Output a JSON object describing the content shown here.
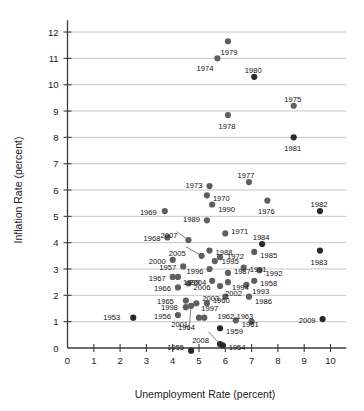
{
  "chart_data": {
    "type": "scatter",
    "title": "",
    "xlabel": "Unemployment Rate (percent)",
    "ylabel": "Inflation Rate (percent)",
    "xlim": [
      0,
      10.6
    ],
    "ylim": [
      0,
      12.4
    ],
    "xticks": [
      "0",
      "1",
      "2",
      "3",
      "4",
      "5",
      "6",
      "7",
      "8",
      "9",
      "10"
    ],
    "yticks": [
      "0",
      "1",
      "2",
      "3",
      "4",
      "5",
      "6",
      "7",
      "8",
      "9",
      "10",
      "11",
      "12"
    ],
    "grid": "horizontal",
    "legend": "none",
    "point_label_key": "year",
    "points": [
      {
        "year": "1953",
        "x": 2.5,
        "y": 1.15,
        "lx": -13,
        "ly": -1,
        "anchor": "end",
        "dark": true
      },
      {
        "year": "1954",
        "x": 5.9,
        "y": 0.1,
        "lx": 6,
        "ly": 2,
        "anchor": "start",
        "dark": true
      },
      {
        "year": "1955",
        "x": 4.7,
        "y": -0.1,
        "lx": -7,
        "ly": -4,
        "anchor": "end",
        "dark": true
      },
      {
        "year": "1956",
        "x": 4.2,
        "y": 1.25,
        "lx": -7,
        "ly": 1,
        "anchor": "end",
        "dark": false
      },
      {
        "year": "1957",
        "x": 4.4,
        "y": 3.1,
        "lx": -7,
        "ly": 1,
        "anchor": "end",
        "dark": false
      },
      {
        "year": "1958",
        "x": 7.1,
        "y": 2.55,
        "lx": 6,
        "ly": 2,
        "anchor": "start",
        "dark": false
      },
      {
        "year": "1959",
        "x": 5.8,
        "y": 0.75,
        "lx": 6,
        "ly": 3,
        "anchor": "start",
        "dark": true
      },
      {
        "year": "1960",
        "x": 5.3,
        "y": 1.7,
        "lx": 6,
        "ly": -3,
        "anchor": "start",
        "dark": false
      },
      {
        "year": "1961",
        "x": 6.4,
        "y": 1.05,
        "lx": 6,
        "ly": 4,
        "anchor": "start",
        "dark": false
      },
      {
        "year": "1962",
        "x": 5.2,
        "y": 1.15,
        "lx": 7,
        "ly": -3,
        "anchor": "start",
        "dark": false
      },
      {
        "year": "1963",
        "x": 7.0,
        "y": 1.0,
        "lx": -3,
        "ly": -4,
        "anchor": "end",
        "dark": false
      },
      {
        "year": "1964",
        "x": 5.0,
        "y": 1.15,
        "lx": -4,
        "ly": 9,
        "anchor": "end",
        "dark": false
      },
      {
        "year": "1965",
        "x": 4.5,
        "y": 1.8,
        "lx": -12,
        "ly": 0,
        "anchor": "end",
        "dark": false
      },
      {
        "year": "1966",
        "x": 4.2,
        "y": 2.3,
        "lx": -7,
        "ly": 1,
        "anchor": "end",
        "dark": false
      },
      {
        "year": "1967",
        "x": 4.0,
        "y": 2.7,
        "lx": -7,
        "ly": 1,
        "anchor": "end",
        "dark": false
      },
      {
        "year": "1968",
        "x": 3.8,
        "y": 4.2,
        "lx": -7,
        "ly": 1,
        "anchor": "end",
        "dark": false
      },
      {
        "year": "1969",
        "x": 3.7,
        "y": 5.2,
        "lx": -8,
        "ly": 1,
        "anchor": "end",
        "dark": false
      },
      {
        "year": "1970",
        "x": 5.3,
        "y": 5.8,
        "lx": 6,
        "ly": 3,
        "anchor": "start",
        "dark": false
      },
      {
        "year": "1971",
        "x": 6.0,
        "y": 4.35,
        "lx": 6,
        "ly": -2,
        "anchor": "start",
        "dark": false
      },
      {
        "year": "1972",
        "x": 5.8,
        "y": 3.45,
        "lx": 7,
        "ly": -1,
        "anchor": "start",
        "dark": false
      },
      {
        "year": "1973",
        "x": 5.4,
        "y": 6.15,
        "lx": -7,
        "ly": -1,
        "anchor": "end",
        "dark": false
      },
      {
        "year": "1974",
        "x": 5.7,
        "y": 11.0,
        "lx": -4,
        "ly": 10,
        "anchor": "end",
        "dark": false
      },
      {
        "year": "1975",
        "x": 8.6,
        "y": 9.2,
        "lx": -1,
        "ly": -7,
        "anchor": "middle",
        "dark": false
      },
      {
        "year": "1976",
        "x": 7.6,
        "y": 5.6,
        "lx": -1,
        "ly": 10,
        "anchor": "middle",
        "dark": false
      },
      {
        "year": "1977",
        "x": 6.9,
        "y": 6.3,
        "lx": -3,
        "ly": -7,
        "anchor": "middle",
        "dark": false
      },
      {
        "year": "1978",
        "x": 6.1,
        "y": 8.85,
        "lx": -1,
        "ly": 11,
        "anchor": "middle",
        "dark": false
      },
      {
        "year": "1979",
        "x": 6.1,
        "y": 11.65,
        "lx": 1,
        "ly": 11,
        "anchor": "middle",
        "dark": false
      },
      {
        "year": "1980",
        "x": 7.1,
        "y": 10.3,
        "lx": -1,
        "ly": -7,
        "anchor": "middle",
        "dark": true
      },
      {
        "year": "1981",
        "x": 8.6,
        "y": 8.0,
        "lx": -1,
        "ly": 11,
        "anchor": "middle",
        "dark": true
      },
      {
        "year": "1982",
        "x": 9.6,
        "y": 5.2,
        "lx": -1,
        "ly": -7,
        "anchor": "middle",
        "dark": true
      },
      {
        "year": "1983",
        "x": 9.6,
        "y": 3.7,
        "lx": -1,
        "ly": 11,
        "anchor": "middle",
        "dark": true
      },
      {
        "year": "1984",
        "x": 7.4,
        "y": 3.95,
        "lx": -1,
        "ly": -7,
        "anchor": "middle",
        "dark": true
      },
      {
        "year": "1985",
        "x": 7.1,
        "y": 3.65,
        "lx": 6,
        "ly": 3,
        "anchor": "start",
        "dark": false
      },
      {
        "year": "1986",
        "x": 6.9,
        "y": 1.95,
        "lx": 6,
        "ly": 4,
        "anchor": "start",
        "dark": false
      },
      {
        "year": "1987",
        "x": 6.1,
        "y": 2.85,
        "lx": 6,
        "ly": -2,
        "anchor": "start",
        "dark": false
      },
      {
        "year": "1988",
        "x": 5.4,
        "y": 3.7,
        "lx": 6,
        "ly": 1,
        "anchor": "start",
        "dark": false
      },
      {
        "year": "1989",
        "x": 5.3,
        "y": 4.85,
        "lx": -7,
        "ly": -1,
        "anchor": "end",
        "dark": false
      },
      {
        "year": "1990",
        "x": 5.5,
        "y": 5.45,
        "lx": 6,
        "ly": 4,
        "anchor": "start",
        "dark": false
      },
      {
        "year": "1991",
        "x": 6.7,
        "y": 3.05,
        "lx": 6,
        "ly": 1,
        "anchor": "start",
        "dark": false
      },
      {
        "year": "1992",
        "x": 7.3,
        "y": 2.95,
        "lx": 6,
        "ly": 3,
        "anchor": "start",
        "dark": false
      },
      {
        "year": "1993",
        "x": 6.8,
        "y": 2.4,
        "lx": 6,
        "ly": 6,
        "anchor": "start",
        "dark": false
      },
      {
        "year": "1994",
        "x": 6.1,
        "y": 2.5,
        "lx": 4,
        "ly": 5,
        "anchor": "start",
        "dark": false
      },
      {
        "year": "1995",
        "x": 5.6,
        "y": 3.3,
        "lx": 7,
        "ly": 0,
        "anchor": "start",
        "dark": false
      },
      {
        "year": "1996",
        "x": 5.4,
        "y": 3.0,
        "lx": -6,
        "ly": 2,
        "anchor": "end",
        "dark": false
      },
      {
        "year": "1997",
        "x": 4.9,
        "y": 1.7,
        "lx": 5,
        "ly": 5,
        "anchor": "start",
        "dark": false
      },
      {
        "year": "1998",
        "x": 4.5,
        "y": 1.55,
        "lx": -8,
        "ly": 0,
        "anchor": "end",
        "dark": false
      },
      {
        "year": "1999",
        "x": 4.2,
        "y": 2.7,
        "lx": 5,
        "ly": 5,
        "anchor": "start",
        "dark": false
      },
      {
        "year": "2000",
        "x": 4.0,
        "y": 3.35,
        "lx": -7,
        "ly": 1,
        "anchor": "end",
        "dark": false
      },
      {
        "year": "2001",
        "x": 4.7,
        "y": 1.6,
        "lx": -3,
        "ly": 18,
        "anchor": "end",
        "dark": false
      },
      {
        "year": "2002",
        "x": 5.8,
        "y": 2.35,
        "lx": 5,
        "ly": 7,
        "anchor": "start",
        "dark": false
      },
      {
        "year": "2003",
        "x": 6.0,
        "y": 1.95,
        "lx": -6,
        "ly": 1,
        "anchor": "end",
        "dark": false
      },
      {
        "year": "2004",
        "x": 5.5,
        "y": 2.55,
        "lx": -6,
        "ly": 1,
        "anchor": "end",
        "dark": false
      },
      {
        "year": "2005",
        "x": 5.1,
        "y": 3.5,
        "lx": -16,
        "ly": -3,
        "anchor": "end",
        "dark": false
      },
      {
        "year": "2006",
        "x": 4.6,
        "y": 2.45,
        "lx": 5,
        "ly": 4,
        "anchor": "start",
        "dark": false
      },
      {
        "year": "2007",
        "x": 4.6,
        "y": 4.1,
        "lx": -11,
        "ly": -5,
        "anchor": "end",
        "dark": false
      },
      {
        "year": "2008",
        "x": 5.8,
        "y": 0.15,
        "lx": -11,
        "ly": -4,
        "anchor": "end",
        "dark": true
      },
      {
        "year": "2009",
        "x": 9.7,
        "y": 1.1,
        "lx": -7,
        "ly": 1,
        "anchor": "end",
        "dark": true
      }
    ],
    "combined_labels": [
      {
        "text": "1962,1963",
        "x": 5.7,
        "y": 1.22,
        "anchor": "start"
      }
    ],
    "leaders": [
      {
        "x1": 4.6,
        "y1": 4.1,
        "x2": 4.15,
        "y2": 4.42
      },
      {
        "x1": 5.1,
        "y1": 3.5,
        "x2": 4.5,
        "y2": 3.85
      },
      {
        "x1": 4.7,
        "y1": 1.6,
        "x2": 4.62,
        "y2": 0.72
      },
      {
        "x1": 5.8,
        "y1": 0.15,
        "x2": 5.35,
        "y2": 0.62
      }
    ]
  }
}
